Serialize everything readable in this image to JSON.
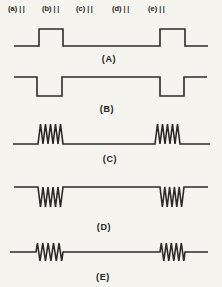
{
  "figure": {
    "background": "#f5f4ef",
    "ink": "#2b2b2b",
    "top_labels": [
      {
        "label": "(a)",
        "marks": "||",
        "x": 8,
        "y": 4
      },
      {
        "label": "(b)",
        "marks": "||",
        "x": 42,
        "y": 4
      },
      {
        "label": "(c)",
        "marks": "||",
        "x": 76,
        "y": 4
      },
      {
        "label": "(d)",
        "marks": "||",
        "x": 112,
        "y": 4
      },
      {
        "label": "(e)",
        "marks": "||",
        "x": 148,
        "y": 4
      }
    ],
    "waveforms": [
      {
        "label": "(A)",
        "type": "pulse-up",
        "baseline_y": 46,
        "amplitude": 17,
        "x_start": 14,
        "x_end": 208,
        "cycles": 0,
        "pulses": [
          [
            39,
            63
          ],
          [
            160,
            185
          ]
        ],
        "label_pos": {
          "x": 109,
          "y": 54
        }
      },
      {
        "label": "(B)",
        "type": "pulse-down",
        "baseline_y": 77,
        "amplitude": 19,
        "x_start": 14,
        "x_end": 207,
        "cycles": 0,
        "pulses": [
          [
            37,
            62
          ],
          [
            160,
            184
          ]
        ],
        "label_pos": {
          "x": 107,
          "y": 104
        }
      },
      {
        "label": "(C)",
        "type": "burst-up",
        "baseline_y": 144,
        "amplitude": 20,
        "x_start": 13,
        "x_end": 210,
        "cycles": 5,
        "pulses": [
          [
            38,
            63
          ],
          [
            155,
            180
          ]
        ],
        "label_pos": {
          "x": 110,
          "y": 154
        }
      },
      {
        "label": "(D)",
        "type": "burst-down",
        "baseline_y": 187,
        "amplitude": 20,
        "x_start": 14,
        "x_end": 208,
        "cycles": 5,
        "pulses": [
          [
            38,
            63
          ],
          [
            160,
            184
          ]
        ],
        "label_pos": {
          "x": 104,
          "y": 222
        }
      },
      {
        "label": "(E)",
        "type": "burst-bipolar",
        "baseline_y": 252,
        "amplitude": 9,
        "x_start": 10,
        "x_end": 208,
        "cycles": 5,
        "pulses": [
          [
            36,
            63
          ],
          [
            160,
            185
          ]
        ],
        "label_pos": {
          "x": 103,
          "y": 272
        }
      }
    ]
  }
}
